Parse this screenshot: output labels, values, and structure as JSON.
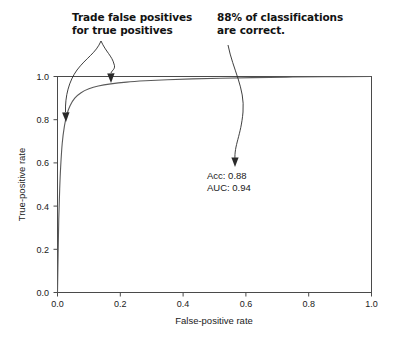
{
  "chart_data": {
    "type": "line",
    "title": "",
    "xlabel": "False-positive rate",
    "ylabel": "True-positive rate",
    "xlim": [
      0.0,
      1.0
    ],
    "ylim": [
      0.0,
      1.0
    ],
    "grid": false,
    "legend": null,
    "xticks": [
      "0.0",
      "0.2",
      "0.4",
      "0.6",
      "0.8",
      "1.0"
    ],
    "yticks": [
      "0.0",
      "0.2",
      "0.4",
      "0.6",
      "0.8",
      "1.0"
    ],
    "xtick_values": [
      0.0,
      0.2,
      0.4,
      0.6,
      0.8,
      1.0
    ],
    "ytick_values": [
      0.0,
      0.2,
      0.4,
      0.6,
      0.8,
      1.0
    ],
    "series": [
      {
        "name": "ROC curve",
        "x": [
          0.0,
          0.002,
          0.004,
          0.007,
          0.01,
          0.015,
          0.022,
          0.03,
          0.04,
          0.055,
          0.075,
          0.1,
          0.13,
          0.17,
          0.22,
          0.28,
          0.35,
          0.43,
          0.52,
          0.62,
          0.73,
          0.85,
          1.0
        ],
        "y": [
          0.0,
          0.18,
          0.34,
          0.48,
          0.58,
          0.69,
          0.77,
          0.825,
          0.865,
          0.9,
          0.925,
          0.943,
          0.956,
          0.966,
          0.974,
          0.98,
          0.985,
          0.989,
          0.992,
          0.995,
          0.997,
          0.999,
          1.0
        ]
      }
    ],
    "annotations": {
      "stats": {
        "accuracy_label": "Acc: 0.88",
        "auc_label": "AUC: 0.94",
        "accuracy_value": 0.88,
        "auc_value": 0.94
      },
      "callouts": [
        {
          "id": "trade-off",
          "line1": "Trade false positives",
          "line2": "for true positives"
        },
        {
          "id": "accuracy",
          "line1": "88% of classifications",
          "line2": "are correct."
        }
      ]
    }
  },
  "chart": {
    "axes": {
      "x_title": "False-positive rate",
      "y_title": "True-positive rate",
      "x_ticks": [
        "0.0",
        "0.2",
        "0.4",
        "0.6",
        "0.8",
        "1.0"
      ],
      "y_ticks": [
        "0.0",
        "0.2",
        "0.4",
        "0.6",
        "0.8",
        "1.0"
      ]
    },
    "stats": {
      "acc": "Acc: 0.88",
      "auc": "AUC: 0.94"
    }
  },
  "annotations": {
    "left": {
      "line1": "Trade false positives",
      "line2": "for true positives"
    },
    "right": {
      "line1": "88% of classifications",
      "line2": "are correct."
    }
  },
  "colors": {
    "curve": "#5a5a5a",
    "axis": "#4a4a4a",
    "text": "#1a1a1a",
    "annotation": "#121212",
    "background": "#ffffff"
  }
}
